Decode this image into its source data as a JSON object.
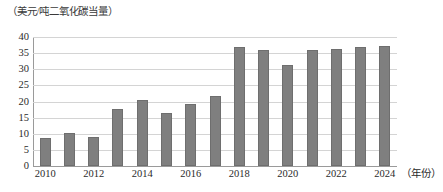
{
  "chart_data": {
    "type": "bar",
    "title": "",
    "ylabel": "（美元/吨二氧化碳当量）",
    "xlabel": "（年份）",
    "categories": [
      "2010",
      "2011",
      "2012",
      "2013",
      "2014",
      "2015",
      "2016",
      "2017",
      "2018",
      "2019",
      "2020",
      "2021",
      "2022",
      "2023",
      "2024"
    ],
    "values": [
      8.8,
      10.2,
      9.0,
      17.8,
      20.5,
      16.5,
      19.2,
      21.6,
      37.0,
      36.0,
      31.2,
      36.0,
      36.4,
      36.8,
      37.3
    ],
    "ylim": [
      0,
      40
    ],
    "ytick_step": 5,
    "yticks": [
      "40",
      "35",
      "30",
      "25",
      "20",
      "15",
      "10",
      "5",
      "0"
    ],
    "xtick_labels": [
      "2010",
      "2012",
      "2014",
      "2016",
      "2018",
      "2020",
      "2022",
      "2024"
    ],
    "xtick_categories": [
      "2010",
      "2012",
      "2014",
      "2016",
      "2018",
      "2020",
      "2022",
      "2024"
    ],
    "grid": true,
    "grid_orientation": "horizontal",
    "legend": "none",
    "series": [
      {
        "name": "碳价",
        "values": [
          8.8,
          10.2,
          9.0,
          17.8,
          20.5,
          16.5,
          19.2,
          21.6,
          37.0,
          36.0,
          31.2,
          36.0,
          36.4,
          36.8,
          37.3
        ]
      }
    ],
    "colors": {
      "bar": "#7f7f7f",
      "bar_border": "#6e6e6e",
      "gridline": "#d4d4d4",
      "axis": "#9a9a9a",
      "text": "#2b2b2b",
      "background": "#ffffff"
    }
  }
}
